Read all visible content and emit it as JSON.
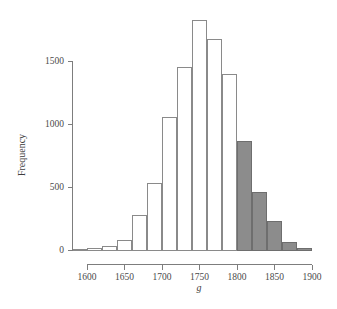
{
  "chart_data": {
    "type": "bar",
    "title": "",
    "subtitle": "",
    "xlabel": "g",
    "ylabel": "Frequency",
    "xlim": [
      1580,
      1900
    ],
    "ylim": [
      0,
      1850
    ],
    "grid": false,
    "legend": null,
    "bin_width": 20,
    "x_ticks": [
      1600,
      1650,
      1700,
      1750,
      1800,
      1850,
      1900
    ],
    "x_tick_labels": [
      "1600",
      "1650",
      "1700",
      "1750",
      "1800",
      "1850",
      "1900"
    ],
    "y_ticks": [
      0,
      500,
      1000,
      1500
    ],
    "y_tick_labels": [
      "0",
      "500",
      "1000",
      "1500"
    ],
    "colors": {
      "bar_open_fill": "#ffffff",
      "bar_open_stroke": "#8a8a8a",
      "bar_filled_fill": "#8c8c8c",
      "bar_filled_stroke": "#6e6e6e",
      "axis": "#7d7d7d",
      "text": "#3d3d3d",
      "background": "#ffffff"
    },
    "bins": [
      {
        "x0": 1580,
        "x1": 1600,
        "value": 5,
        "style": "open"
      },
      {
        "x0": 1600,
        "x1": 1620,
        "value": 12,
        "style": "open"
      },
      {
        "x0": 1620,
        "x1": 1640,
        "value": 28,
        "style": "open"
      },
      {
        "x0": 1640,
        "x1": 1660,
        "value": 78,
        "style": "open"
      },
      {
        "x0": 1660,
        "x1": 1680,
        "value": 270,
        "style": "open"
      },
      {
        "x0": 1680,
        "x1": 1700,
        "value": 530,
        "style": "open"
      },
      {
        "x0": 1700,
        "x1": 1720,
        "value": 1050,
        "style": "open"
      },
      {
        "x0": 1720,
        "x1": 1740,
        "value": 1450,
        "style": "open"
      },
      {
        "x0": 1740,
        "x1": 1760,
        "value": 1820,
        "style": "open"
      },
      {
        "x0": 1760,
        "x1": 1780,
        "value": 1670,
        "style": "open"
      },
      {
        "x0": 1780,
        "x1": 1800,
        "value": 1390,
        "style": "open"
      },
      {
        "x0": 1800,
        "x1": 1820,
        "value": 860,
        "style": "filled"
      },
      {
        "x0": 1820,
        "x1": 1840,
        "value": 460,
        "style": "filled"
      },
      {
        "x0": 1840,
        "x1": 1860,
        "value": 230,
        "style": "filled"
      },
      {
        "x0": 1860,
        "x1": 1880,
        "value": 60,
        "style": "filled"
      },
      {
        "x0": 1880,
        "x1": 1900,
        "value": 15,
        "style": "filled"
      }
    ],
    "categories": [
      "1580-1600",
      "1600-1620",
      "1620-1640",
      "1640-1660",
      "1660-1680",
      "1680-1700",
      "1700-1720",
      "1720-1740",
      "1740-1760",
      "1760-1780",
      "1780-1800",
      "1800-1820",
      "1820-1840",
      "1840-1860",
      "1860-1880",
      "1880-1900"
    ],
    "values": [
      5,
      12,
      28,
      78,
      270,
      530,
      1050,
      1450,
      1820,
      1670,
      1390,
      860,
      460,
      230,
      60,
      15
    ]
  }
}
